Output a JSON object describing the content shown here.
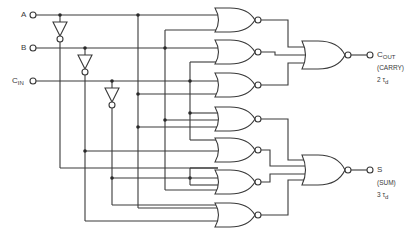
{
  "diagram": {
    "type": "full-adder NOR gate logic circuit",
    "inputs": [
      {
        "label": "A",
        "sub": ""
      },
      {
        "label": "B",
        "sub": ""
      },
      {
        "label": "C",
        "sub": "IN"
      }
    ],
    "outputs": [
      {
        "label": "C",
        "sub": "OUT",
        "desc": "(CARRY)",
        "delay_num": "2",
        "delay_sym": "τ",
        "delay_sub": "d"
      },
      {
        "label": "S",
        "sub": "",
        "desc": "(SUM)",
        "delay_num": "3",
        "delay_sym": "τ",
        "delay_sub": "d"
      }
    ],
    "gates": {
      "inverters": 3,
      "first_level_nor": 7,
      "output_nor": 2
    },
    "colors": {
      "line": "#3a3a3a",
      "background": "#ffffff"
    }
  }
}
